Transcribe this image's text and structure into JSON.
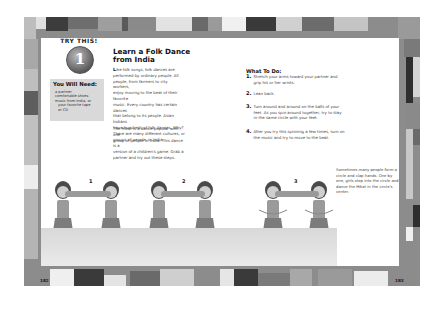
{
  "spread": {
    "border_colors": {
      "dark": "#3a3a3a",
      "mid": "#7a7a7a",
      "light": "#bdbdbd",
      "pale": "#e6e6e6",
      "frame": "#8c8c8c"
    }
  },
  "badge": {
    "arc_text": "TRY THIS!",
    "number": "1"
  },
  "needs": {
    "title": "You Will Need:",
    "items": [
      "a partner",
      "comfortable shoes",
      "music from India, or",
      "your favorite tape",
      "or CD"
    ]
  },
  "activity": {
    "title_line1": "Learn a Folk Dance",
    "title_line2": "from India",
    "intro_dropcap": "L",
    "intro_paragraph": [
      "ike folk songs, folk dances are",
      "performed by ordinary people. All",
      "people, from farmers to city workers,",
      "enjoy moving to the beat of their favorite",
      "music. Every country has certain dances",
      "that belong to its people. Asian Indians",
      "have hundreds of folk dances. Why?",
      "There are many different cultures, or",
      "groups of people, in India."
    ],
    "second_paragraph": [
      "The Hikat is a dance popular with one",
      "group of people in India. This dance is a",
      "version of a children's game. Grab a",
      "partner and try out these steps."
    ]
  },
  "todo": {
    "title": "What To Do:",
    "steps": [
      {
        "num": "1.",
        "text": "Stretch your arms toward your partner and grip his or her wrists."
      },
      {
        "num": "2.",
        "text": "Lean back."
      },
      {
        "num": "3.",
        "text": "Turn around and around on the balls of your feet. As you spin around together, try to stay in the same circle with your feet."
      },
      {
        "num": "4.",
        "text": "After you try this spinning a few times, turn on the music and try to move to the beat."
      }
    ]
  },
  "caption": "Sometimes many people form a circle and clap hands. One by one, girls step into the circle and dance the Hikat in the circle's center.",
  "illustration": {
    "figure_labels": [
      "1",
      "2",
      "3"
    ]
  },
  "page_numbers": {
    "left": "182",
    "right": "183"
  }
}
